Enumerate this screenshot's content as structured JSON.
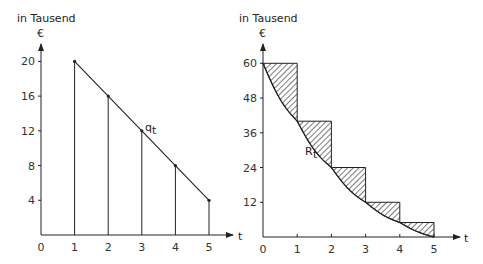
{
  "chart_data": [
    {
      "type": "bar",
      "title": "",
      "ylabel_line1": "in Tausend",
      "ylabel_line2": "€",
      "xlabel": "t",
      "x": [
        1,
        2,
        3,
        4,
        5
      ],
      "values": [
        20,
        16,
        12,
        8,
        4
      ],
      "series_label": "q",
      "series_label_sub": "t",
      "x_ticks": [
        "0",
        "1",
        "2",
        "3",
        "4",
        "5"
      ],
      "y_ticks": [
        "4",
        "8",
        "12",
        "16",
        "20"
      ],
      "ylim": [
        0,
        24
      ],
      "xlim": [
        0,
        5.8
      ],
      "grid": false,
      "style": "stem plot with connecting straight line q_t"
    },
    {
      "type": "area",
      "title": "",
      "ylabel_line1": "in Tausend",
      "ylabel_line2": "€",
      "xlabel": "t",
      "curve_x": [
        0,
        1,
        2,
        3,
        4,
        5
      ],
      "curve_values": [
        60,
        40,
        24,
        12,
        5,
        0
      ],
      "step_values": [
        60,
        40,
        24,
        12,
        5
      ],
      "series_label": "R",
      "series_label_sub": "t",
      "x_ticks": [
        "0",
        "1",
        "2",
        "3",
        "4",
        "5"
      ],
      "y_ticks": [
        "12",
        "24",
        "36",
        "48",
        "60"
      ],
      "ylim": [
        0,
        66
      ],
      "xlim": [
        0,
        5.8
      ],
      "grid": false,
      "style": "step function with hatched area between steps and convex curve R_t"
    }
  ]
}
